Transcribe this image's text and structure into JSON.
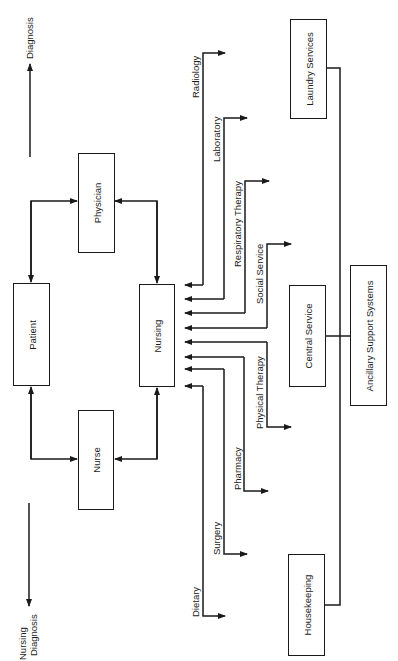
{
  "diagram": {
    "orientation": "rotated-90-ccw",
    "nodes": {
      "physician": {
        "label": "Physician"
      },
      "patient": {
        "label": "Patient"
      },
      "nursing": {
        "label": "Nursing"
      },
      "nurse": {
        "label": "Nurse"
      },
      "central_service": {
        "label": "Central Service"
      },
      "ancillary_support": {
        "label": "Ancillary Support Systems"
      },
      "laundry_services": {
        "label": "Laundry Services"
      },
      "housekeeping": {
        "label": "Housekeeping"
      }
    },
    "outcomes": {
      "diagnosis": {
        "label": "Diagnosis"
      },
      "nursing_diagnosis": {
        "line1": "Nursing",
        "line2": "Diagnosis"
      }
    },
    "departments": [
      {
        "label": "Radiology"
      },
      {
        "label": "Laboratory"
      },
      {
        "label": "Respiratory Therapy"
      },
      {
        "label": "Social Service"
      },
      {
        "label": "Physical Therapy"
      },
      {
        "label": "Pharmacy"
      },
      {
        "label": "Surgery"
      },
      {
        "label": "Dietary"
      }
    ],
    "edges": [
      {
        "from": "Patient",
        "to": "Physician",
        "type": "bidirectional"
      },
      {
        "from": "Physician",
        "to": "Nursing",
        "type": "bidirectional"
      },
      {
        "from": "Patient",
        "to": "Nurse",
        "type": "bidirectional"
      },
      {
        "from": "Nurse",
        "to": "Nursing",
        "type": "bidirectional"
      },
      {
        "from": "Physician side",
        "to": "Diagnosis",
        "type": "arrow"
      },
      {
        "from": "Nurse side",
        "to": "Nursing Diagnosis",
        "type": "arrow"
      },
      {
        "from": "Radiology",
        "to": "Nursing",
        "type": "bidirectional"
      },
      {
        "from": "Laboratory",
        "to": "Nursing",
        "type": "bidirectional"
      },
      {
        "from": "Respiratory Therapy",
        "to": "Nursing",
        "type": "bidirectional"
      },
      {
        "from": "Social Service",
        "to": "Nursing",
        "type": "bidirectional"
      },
      {
        "from": "Physical Therapy",
        "to": "Nursing",
        "type": "bidirectional"
      },
      {
        "from": "Pharmacy",
        "to": "Nursing",
        "type": "bidirectional"
      },
      {
        "from": "Surgery",
        "to": "Nursing",
        "type": "bidirectional"
      },
      {
        "from": "Dietary",
        "to": "Nursing",
        "type": "bidirectional"
      },
      {
        "from": "Laundry Services",
        "to": "Ancillary Support Systems",
        "type": "line"
      },
      {
        "from": "Central Service",
        "to": "Ancillary Support Systems",
        "type": "line"
      },
      {
        "from": "Housekeeping",
        "to": "Ancillary Support Systems",
        "type": "line"
      }
    ]
  }
}
